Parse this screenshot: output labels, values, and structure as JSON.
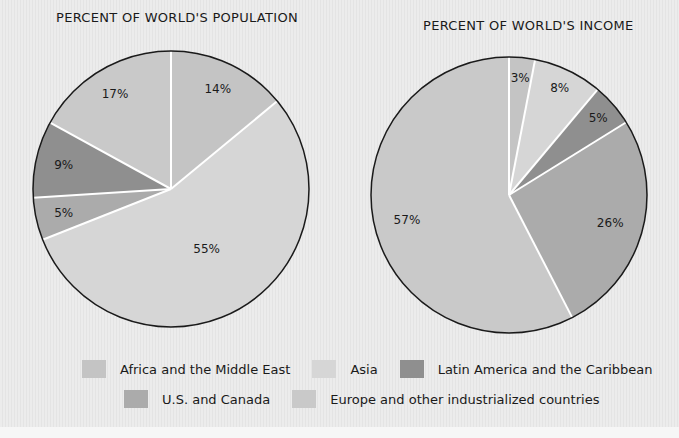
{
  "chart_data": [
    {
      "type": "pie",
      "title": "PERCENT OF WORLD'S POPULATION",
      "categories": [
        "Africa and the Middle East",
        "Asia",
        "U.S. and Canada",
        "Latin America and the Caribbean",
        "Europe and other industrialized countries"
      ],
      "values": [
        14,
        55,
        5,
        9,
        17
      ],
      "labels": [
        "14%",
        "55%",
        "5%",
        "9%",
        "17%"
      ],
      "start": "12 o'clock, clockwise"
    },
    {
      "type": "pie",
      "title": "PERCENT OF WORLD'S INCOME",
      "categories": [
        "Africa and the Middle East",
        "Asia",
        "Latin America and the Caribbean",
        "U.S. and Canada",
        "Europe and other industrialized countries"
      ],
      "values": [
        3,
        8,
        5,
        26,
        57
      ],
      "labels": [
        "3%",
        "8%",
        "5%",
        "26%",
        "57%"
      ],
      "start": "12 o'clock, clockwise"
    }
  ],
  "colors": {
    "Africa and the Middle East": "#c4c4c4",
    "Asia": "#d6d6d6",
    "Latin America and the Caribbean": "#8f8f8f",
    "U.S. and Canada": "#ababab",
    "Europe and other industrialized countries": "#c9c9c9"
  },
  "titles": {
    "population": "PERCENT OF WORLD'S POPULATION",
    "income": "PERCENT OF WORLD'S INCOME"
  },
  "legend": {
    "items": [
      {
        "label": "Africa and the Middle East",
        "color": "#c4c4c4"
      },
      {
        "label": "Asia",
        "color": "#d6d6d6"
      },
      {
        "label": "Latin America and the Caribbean",
        "color": "#8f8f8f"
      },
      {
        "label": "U.S. and Canada",
        "color": "#ababab"
      },
      {
        "label": "Europe and other industrialized countries",
        "color": "#c9c9c9"
      }
    ]
  }
}
